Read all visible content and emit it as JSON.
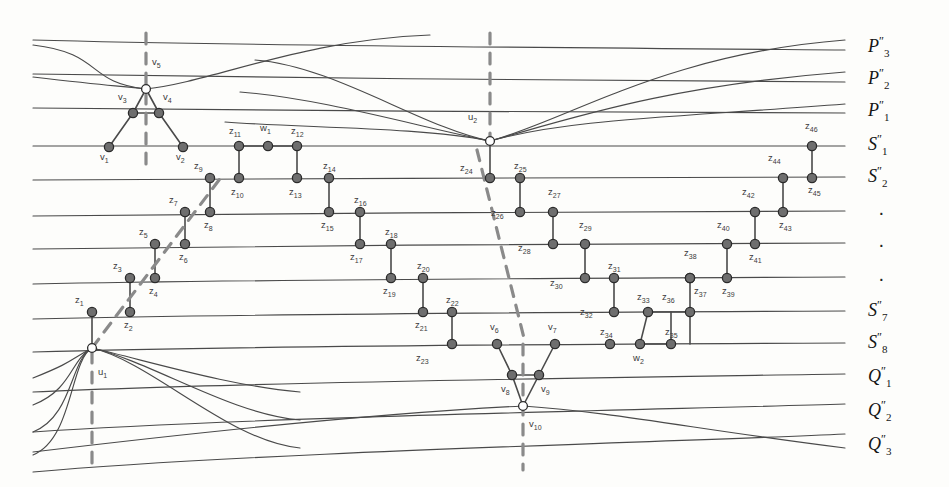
{
  "figure": {
    "type": "graph-drawing",
    "background": "#fdfdfb",
    "edge_color": "#4a4a4a",
    "dash_color": "#8a8a8a",
    "vertex_fill": "#6e6e6e",
    "vertex_stroke": "#2b2b2b",
    "hollow_fill": "#ffffff"
  },
  "right_labels": [
    {
      "id": "P3",
      "base": "P",
      "sub": "3",
      "sup": "″",
      "y": 48
    },
    {
      "id": "P2",
      "base": "P",
      "sub": "2",
      "sup": "″",
      "y": 80
    },
    {
      "id": "P1",
      "base": "P",
      "sub": "1",
      "sup": "″",
      "y": 112
    },
    {
      "id": "S1",
      "base": "S",
      "sub": "1",
      "sup": "″",
      "y": 146
    },
    {
      "id": "S2",
      "base": "S",
      "sub": "2",
      "sup": "″",
      "y": 178
    },
    {
      "id": "dot1",
      "base": "·",
      "sub": "",
      "sup": "",
      "y": 212
    },
    {
      "id": "dot2",
      "base": "·",
      "sub": "",
      "sup": "",
      "y": 244
    },
    {
      "id": "dot3",
      "base": "·",
      "sub": "",
      "sup": "",
      "y": 278
    },
    {
      "id": "S7",
      "base": "S",
      "sub": "7",
      "sup": "″",
      "y": 312
    },
    {
      "id": "S8",
      "base": "S",
      "sub": "8",
      "sup": "″",
      "y": 344
    },
    {
      "id": "Q1",
      "base": "Q",
      "sub": "1",
      "sup": "″",
      "y": 378
    },
    {
      "id": "Q2",
      "base": "Q",
      "sub": "2",
      "sup": "″",
      "y": 412
    },
    {
      "id": "Q3",
      "base": "Q",
      "sub": "3",
      "sup": "″",
      "y": 446
    }
  ],
  "vertices": {
    "u": [
      {
        "id": "u1",
        "label": "u",
        "sub": "1",
        "x": 92,
        "y": 348,
        "style": "hollow",
        "lx": 98,
        "ly": 372
      },
      {
        "id": "u2",
        "label": "u",
        "sub": "2",
        "x": 490,
        "y": 141,
        "style": "hollow",
        "lx": 468,
        "ly": 117
      }
    ],
    "v": [
      {
        "id": "v1",
        "label": "v",
        "sub": "1",
        "x": 109,
        "y": 147,
        "style": "solid",
        "lx": 100,
        "ly": 157
      },
      {
        "id": "v2",
        "label": "v",
        "sub": "2",
        "x": 183,
        "y": 147,
        "style": "solid",
        "lx": 176,
        "ly": 157
      },
      {
        "id": "v3",
        "label": "v",
        "sub": "3",
        "x": 133,
        "y": 113,
        "style": "solid",
        "lx": 118,
        "ly": 97
      },
      {
        "id": "v4",
        "label": "v",
        "sub": "4",
        "x": 159,
        "y": 113,
        "style": "solid",
        "lx": 163,
        "ly": 97
      },
      {
        "id": "v5",
        "label": "v",
        "sub": "5",
        "x": 146,
        "y": 89,
        "style": "hollow",
        "lx": 152,
        "ly": 62
      },
      {
        "id": "v6",
        "label": "v",
        "sub": "6",
        "x": 497,
        "y": 344,
        "style": "solid",
        "lx": 490,
        "ly": 327
      },
      {
        "id": "v7",
        "label": "v",
        "sub": "7",
        "x": 555,
        "y": 344,
        "style": "solid",
        "lx": 548,
        "ly": 327
      },
      {
        "id": "v8",
        "label": "v",
        "sub": "8",
        "x": 512,
        "y": 375,
        "style": "solid",
        "lx": 501,
        "ly": 389
      },
      {
        "id": "v9",
        "label": "v",
        "sub": "9",
        "x": 539,
        "y": 375,
        "style": "solid",
        "lx": 541,
        "ly": 389
      },
      {
        "id": "v10",
        "label": "v",
        "sub": "10",
        "x": 523,
        "y": 406,
        "style": "hollow",
        "lx": 529,
        "ly": 424
      }
    ],
    "w": [
      {
        "id": "w1",
        "label": "w",
        "sub": "1",
        "x": 268,
        "y": 146,
        "style": "solid",
        "lx": 260,
        "ly": 128
      },
      {
        "id": "w2",
        "label": "w",
        "sub": "2",
        "x": 640,
        "y": 344,
        "style": "solid",
        "lx": 633,
        "ly": 358
      }
    ],
    "z": [
      {
        "id": "z1",
        "label": "z",
        "sub": "1",
        "x": 92,
        "y": 312,
        "lx": 75,
        "ly": 300
      },
      {
        "id": "z2",
        "label": "z",
        "sub": "2",
        "x": 130,
        "y": 312,
        "lx": 124,
        "ly": 325
      },
      {
        "id": "z3",
        "label": "z",
        "sub": "3",
        "x": 130,
        "y": 278,
        "lx": 113,
        "ly": 266
      },
      {
        "id": "z4",
        "label": "z",
        "sub": "4",
        "x": 155,
        "y": 278,
        "lx": 149,
        "ly": 291
      },
      {
        "id": "z5",
        "label": "z",
        "sub": "5",
        "x": 155,
        "y": 244,
        "lx": 139,
        "ly": 232
      },
      {
        "id": "z6",
        "label": "z",
        "sub": "6",
        "x": 185,
        "y": 244,
        "lx": 179,
        "ly": 257
      },
      {
        "id": "z7",
        "label": "z",
        "sub": "7",
        "x": 185,
        "y": 212,
        "lx": 169,
        "ly": 200
      },
      {
        "id": "z8",
        "label": "z",
        "sub": "8",
        "x": 210,
        "y": 212,
        "lx": 204,
        "ly": 225
      },
      {
        "id": "z9",
        "label": "z",
        "sub": "9",
        "x": 210,
        "y": 178,
        "lx": 194,
        "ly": 166
      },
      {
        "id": "z10",
        "label": "z",
        "sub": "10",
        "x": 239,
        "y": 178,
        "lx": 231,
        "ly": 192
      },
      {
        "id": "z11",
        "label": "z",
        "sub": "11",
        "x": 239,
        "y": 146,
        "lx": 229,
        "ly": 131
      },
      {
        "id": "z12",
        "label": "z",
        "sub": "12",
        "x": 297,
        "y": 146,
        "lx": 291,
        "ly": 131
      },
      {
        "id": "z13",
        "label": "z",
        "sub": "13",
        "x": 297,
        "y": 178,
        "lx": 289,
        "ly": 192
      },
      {
        "id": "z14",
        "label": "z",
        "sub": "14",
        "x": 329,
        "y": 178,
        "lx": 323,
        "ly": 166
      },
      {
        "id": "z15",
        "label": "z",
        "sub": "15",
        "x": 329,
        "y": 212,
        "lx": 321,
        "ly": 225
      },
      {
        "id": "z16",
        "label": "z",
        "sub": "16",
        "x": 360,
        "y": 212,
        "lx": 354,
        "ly": 200
      },
      {
        "id": "z17",
        "label": "z",
        "sub": "17",
        "x": 360,
        "y": 244,
        "lx": 350,
        "ly": 257
      },
      {
        "id": "z18",
        "label": "z",
        "sub": "18",
        "x": 391,
        "y": 244,
        "lx": 385,
        "ly": 232
      },
      {
        "id": "z19",
        "label": "z",
        "sub": "19",
        "x": 391,
        "y": 278,
        "lx": 383,
        "ly": 291
      },
      {
        "id": "z20",
        "label": "z",
        "sub": "20",
        "x": 423,
        "y": 278,
        "lx": 417,
        "ly": 266
      },
      {
        "id": "z21",
        "label": "z",
        "sub": "21",
        "x": 423,
        "y": 312,
        "lx": 415,
        "ly": 325
      },
      {
        "id": "z22",
        "label": "z",
        "sub": "22",
        "x": 452,
        "y": 312,
        "lx": 446,
        "ly": 300
      },
      {
        "id": "z23",
        "label": "z",
        "sub": "23",
        "x": 452,
        "y": 344,
        "lx": 416,
        "ly": 358
      },
      {
        "id": "z24",
        "label": "z",
        "sub": "24",
        "x": 490,
        "y": 178,
        "lx": 460,
        "ly": 168
      },
      {
        "id": "z25",
        "label": "z",
        "sub": "25",
        "x": 520,
        "y": 178,
        "lx": 514,
        "ly": 166
      },
      {
        "id": "z26",
        "label": "z",
        "sub": "26",
        "x": 520,
        "y": 212,
        "lx": 491,
        "ly": 213
      },
      {
        "id": "z27",
        "label": "z",
        "sub": "27",
        "x": 553,
        "y": 212,
        "lx": 548,
        "ly": 192
      },
      {
        "id": "z28",
        "label": "z",
        "sub": "28",
        "x": 553,
        "y": 244,
        "lx": 518,
        "ly": 248
      },
      {
        "id": "z29",
        "label": "z",
        "sub": "29",
        "x": 585,
        "y": 244,
        "lx": 579,
        "ly": 225
      },
      {
        "id": "z30",
        "label": "z",
        "sub": "30",
        "x": 585,
        "y": 278,
        "lx": 550,
        "ly": 283
      },
      {
        "id": "z31",
        "label": "z",
        "sub": "31",
        "x": 614,
        "y": 278,
        "lx": 608,
        "ly": 266
      },
      {
        "id": "z32",
        "label": "z",
        "sub": "32",
        "x": 614,
        "y": 312,
        "lx": 580,
        "ly": 312
      },
      {
        "id": "z33",
        "label": "z",
        "sub": "33",
        "x": 648,
        "y": 312,
        "lx": 637,
        "ly": 297
      },
      {
        "id": "z34",
        "label": "z",
        "sub": "34",
        "x": 610,
        "y": 344,
        "lx": 600,
        "ly": 332
      },
      {
        "id": "z35",
        "label": "z",
        "sub": "35",
        "x": 671,
        "y": 344,
        "lx": 665,
        "ly": 332
      },
      {
        "id": "z36",
        "label": "z",
        "sub": "36",
        "x": 690,
        "y": 312,
        "lx": 662,
        "ly": 297
      },
      {
        "id": "z37",
        "label": "z",
        "sub": "37",
        "x": 690,
        "y": 278,
        "lx": 694,
        "ly": 291
      },
      {
        "id": "z38",
        "label": "z",
        "sub": "38",
        "x": 690,
        "y": 278,
        "lx": 684,
        "ly": 253
      },
      {
        "id": "z39",
        "label": "z",
        "sub": "39",
        "x": 727,
        "y": 278,
        "lx": 722,
        "ly": 291
      },
      {
        "id": "z40",
        "label": "z",
        "sub": "40",
        "x": 727,
        "y": 244,
        "lx": 717,
        "ly": 225
      },
      {
        "id": "z41",
        "label": "z",
        "sub": "41",
        "x": 755,
        "y": 244,
        "lx": 749,
        "ly": 257
      },
      {
        "id": "z42",
        "label": "z",
        "sub": "42",
        "x": 755,
        "y": 212,
        "lx": 742,
        "ly": 192
      },
      {
        "id": "z43",
        "label": "z",
        "sub": "43",
        "x": 783,
        "y": 212,
        "lx": 779,
        "ly": 225
      },
      {
        "id": "z44",
        "label": "z",
        "sub": "44",
        "x": 783,
        "y": 178,
        "lx": 768,
        "ly": 158
      },
      {
        "id": "z45",
        "label": "z",
        "sub": "45",
        "x": 812,
        "y": 178,
        "lx": 808,
        "ly": 190
      },
      {
        "id": "z46",
        "label": "z",
        "sub": "46",
        "x": 812,
        "y": 146,
        "lx": 805,
        "ly": 126
      }
    ]
  },
  "dashed_segments": {
    "left_vertical": {
      "x": 146,
      "y1": 33,
      "y2": 170
    },
    "left_diagonal": {
      "x1": 92,
      "y1": 348,
      "x2": 222,
      "y2": 176
    },
    "left_lower": {
      "x": 92,
      "y1": 352,
      "y2": 470
    },
    "right_vertical": {
      "x": 490,
      "y1": 33,
      "y2": 138
    },
    "right_diagonal": {
      "x1": 477,
      "y1": 150,
      "x2": 524,
      "y2": 338
    },
    "right_lower": {
      "x": 523,
      "y1": 344,
      "y2": 470
    }
  },
  "zigzags": [
    {
      "name": "v-peak-left",
      "nodes": [
        "v1",
        "v3",
        "v5",
        "v4",
        "v2"
      ]
    },
    {
      "name": "w1-peak",
      "nodes": [
        "z11",
        "w1",
        "z12"
      ]
    },
    {
      "name": "w2-peak",
      "nodes": [
        "z33",
        "w2",
        "z36"
      ]
    },
    {
      "name": "v-valley-right",
      "nodes": [
        "v6",
        "v8",
        "v10",
        "v9",
        "v7"
      ]
    }
  ]
}
